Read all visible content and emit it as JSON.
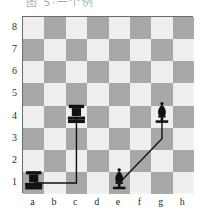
{
  "header": {
    "cropped_text": "图 5·一个例"
  },
  "board": {
    "light_square_color": "#f2f2f0",
    "dark_square_color": "#a9a9a7",
    "border_color": "#6d6d6d",
    "piece_color": "#111111",
    "line_color": "#111111",
    "rank_labels": [
      "8",
      "7",
      "6",
      "5",
      "4",
      "3",
      "2",
      "1"
    ],
    "file_labels": [
      "a",
      "b",
      "c",
      "d",
      "e",
      "f",
      "g",
      "h"
    ]
  },
  "chart_data": {
    "type": "diagram",
    "board_size": 8,
    "files": [
      "a",
      "b",
      "c",
      "d",
      "e",
      "f",
      "g",
      "h"
    ],
    "ranks": [
      "1",
      "2",
      "3",
      "4",
      "5",
      "6",
      "7",
      "8"
    ],
    "pieces": [
      {
        "id": "rook-a1",
        "type": "rook",
        "color": "black",
        "file": "a",
        "rank": 1,
        "square": "a1"
      },
      {
        "id": "rook-c4",
        "type": "rook",
        "color": "black",
        "file": "c",
        "rank": 4,
        "square": "c4"
      },
      {
        "id": "bishop-e1",
        "type": "bishop",
        "color": "black",
        "file": "e",
        "rank": 1,
        "square": "e1"
      },
      {
        "id": "bishop-g4",
        "type": "bishop",
        "color": "black",
        "file": "g",
        "rank": 4,
        "square": "g4"
      }
    ],
    "paths": [
      {
        "id": "rook-path",
        "label": "a1 to c4",
        "from": "a1",
        "to": "c4",
        "style": "orthogonal",
        "waypoints": [
          "a1",
          "c1",
          "c4"
        ]
      },
      {
        "id": "bishop-path",
        "label": "e1 to g4",
        "from": "e1",
        "to": "g4",
        "style": "diagonal-then-vertical",
        "waypoints": [
          "e1",
          "g3",
          "g4"
        ]
      }
    ]
  }
}
